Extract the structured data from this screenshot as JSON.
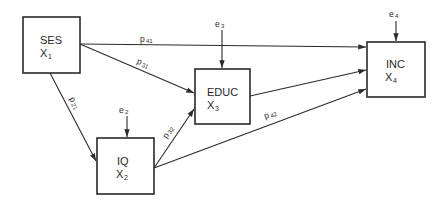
{
  "diagram": {
    "type": "path-diagram",
    "nodes": [
      {
        "id": "ses",
        "label": "SES",
        "var": "X",
        "sub": "1"
      },
      {
        "id": "iq",
        "label": "IQ",
        "var": "X",
        "sub": "2"
      },
      {
        "id": "educ",
        "label": "EDUC",
        "var": "X",
        "sub": "3"
      },
      {
        "id": "inc",
        "label": "INC",
        "var": "X",
        "sub": "4"
      }
    ],
    "errors": [
      {
        "id": "e2",
        "label": "e",
        "sub": "2",
        "target": "iq"
      },
      {
        "id": "e3",
        "label": "e",
        "sub": "3",
        "target": "educ"
      },
      {
        "id": "e4",
        "label": "e",
        "sub": "4",
        "target": "inc"
      }
    ],
    "paths": [
      {
        "id": "p41",
        "label": "p",
        "sub": "41",
        "from": "ses",
        "to": "inc"
      },
      {
        "id": "p31",
        "label": "p",
        "sub": "31",
        "from": "ses",
        "to": "educ"
      },
      {
        "id": "p21",
        "label": "p",
        "sub": "21",
        "from": "ses",
        "to": "iq"
      },
      {
        "id": "p32",
        "label": "p",
        "sub": "32",
        "from": "iq",
        "to": "educ"
      },
      {
        "id": "p42",
        "label": "p",
        "sub": "42",
        "from": "iq",
        "to": "inc"
      },
      {
        "id": "p43",
        "label": "",
        "sub": "",
        "from": "educ",
        "to": "inc"
      }
    ],
    "colors": {
      "ink": "#2a2a2a",
      "background": "#ffffff"
    }
  }
}
